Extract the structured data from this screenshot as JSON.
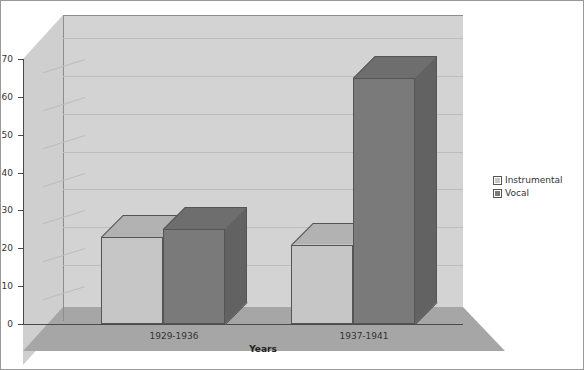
{
  "chart_data": {
    "type": "bar",
    "title": "",
    "subtitle": "",
    "xlabel": "Years",
    "ylabel": "",
    "categories": [
      "1929-1936",
      "1937-1941"
    ],
    "series": [
      {
        "name": "Instrumental",
        "values": [
          23,
          21
        ],
        "color": "#c6c6c6"
      },
      {
        "name": "Vocal",
        "values": [
          25,
          65
        ],
        "color": "#7a7a7a"
      }
    ],
    "ylim": [
      0,
      70
    ],
    "ytick_step": 10,
    "yticks": [
      0,
      10,
      20,
      30,
      40,
      50,
      60,
      70
    ],
    "ytick_labels": [
      "0",
      "10",
      "20",
      "30",
      "40",
      "50",
      "60",
      "70"
    ],
    "grid": true,
    "grid_axis": "y",
    "legend_position": "right",
    "three_d": true,
    "background": "#ffffff",
    "wall_color": "#d3d3d3",
    "floor_color": "#a6a6a6",
    "gridline_color": "#bdbdbd",
    "axis_color": "#4a4a4a",
    "border_color": "#9a9a9a"
  },
  "legend": {
    "items": [
      {
        "label": "Instrumental",
        "color": "#c6c6c6"
      },
      {
        "label": "Vocal",
        "color": "#7a7a7a"
      }
    ]
  },
  "axis": {
    "x_title": "Years"
  }
}
